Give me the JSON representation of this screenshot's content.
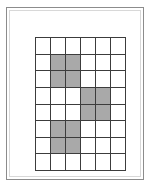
{
  "figure": {
    "title": "",
    "frame": {
      "border_color": "#8c8c8c",
      "background_color": "#ffffff"
    }
  },
  "chart_data": {
    "type": "heatmap",
    "title": "",
    "subtitle": "",
    "xlabel": "",
    "ylabel": "",
    "grid": true,
    "legend": "none",
    "columns": 6,
    "rows": 8,
    "x": [
      1,
      2,
      3,
      4,
      5,
      6
    ],
    "categories": [
      1,
      2,
      3,
      4,
      5,
      6,
      7,
      8
    ],
    "xlim": [
      1,
      6
    ],
    "ylim": [
      1,
      8
    ],
    "value_labels": {
      "0": "empty",
      "1": "shaded"
    },
    "colors": {
      "empty": "#ffffff",
      "shaded": "#a9a9a9",
      "gridline": "#3c3c3c"
    },
    "shaded_cells": [
      {
        "row": 2,
        "col": 2
      },
      {
        "row": 2,
        "col": 3
      },
      {
        "row": 3,
        "col": 2
      },
      {
        "row": 3,
        "col": 3
      },
      {
        "row": 4,
        "col": 4
      },
      {
        "row": 4,
        "col": 5
      },
      {
        "row": 5,
        "col": 4
      },
      {
        "row": 5,
        "col": 5
      },
      {
        "row": 6,
        "col": 2
      },
      {
        "row": 6,
        "col": 3
      },
      {
        "row": 7,
        "col": 2
      },
      {
        "row": 7,
        "col": 3
      }
    ],
    "shaded_count": 12,
    "total_cells": 48,
    "values": [
      [
        0,
        0,
        0,
        0,
        0,
        0
      ],
      [
        0,
        1,
        1,
        0,
        0,
        0
      ],
      [
        0,
        1,
        1,
        0,
        0,
        0
      ],
      [
        0,
        0,
        0,
        1,
        1,
        0
      ],
      [
        0,
        0,
        0,
        1,
        1,
        0
      ],
      [
        0,
        1,
        1,
        0,
        0,
        0
      ],
      [
        0,
        1,
        1,
        0,
        0,
        0
      ],
      [
        0,
        0,
        0,
        0,
        0,
        0
      ]
    ]
  }
}
